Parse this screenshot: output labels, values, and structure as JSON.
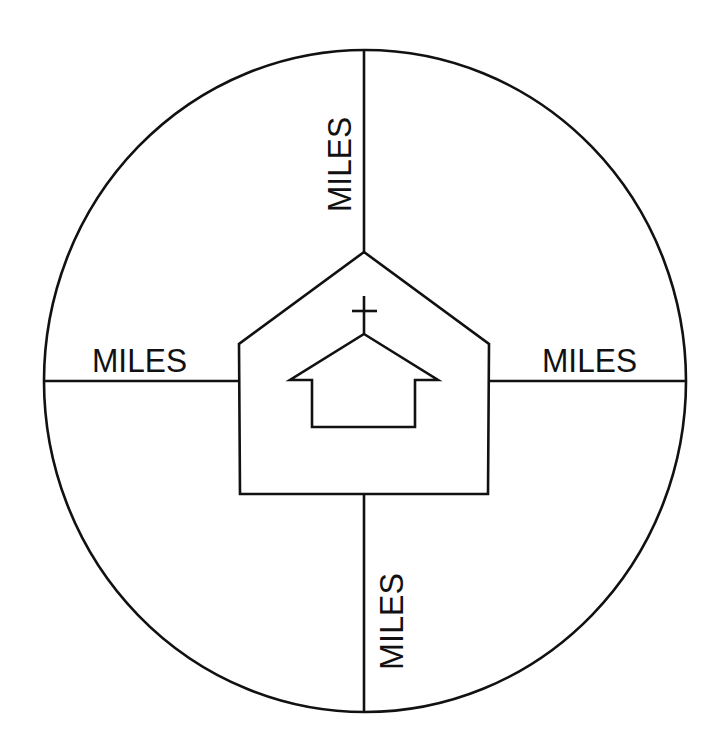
{
  "diagram": {
    "title": "",
    "colors": {
      "stroke": "#111111",
      "background": "#ffffff"
    },
    "outer_circle": {
      "cx": 365,
      "cy": 381,
      "rx": 321,
      "ry": 331
    },
    "center_shape": {
      "type": "pentagon",
      "points": [
        [
          364,
          252
        ],
        [
          489,
          344
        ],
        [
          488,
          494
        ],
        [
          240,
          494
        ],
        [
          239,
          344
        ]
      ]
    },
    "church_icon": {
      "name": "church-icon",
      "outline": [
        [
          364,
          334
        ],
        [
          438,
          380
        ],
        [
          415,
          380
        ],
        [
          415,
          427
        ],
        [
          312,
          427
        ],
        [
          312,
          380
        ],
        [
          290,
          380
        ]
      ],
      "cross": {
        "vertical": [
          [
            364,
            296
          ],
          [
            364,
            334
          ]
        ],
        "horizontal": [
          [
            352,
            311
          ],
          [
            377,
            311
          ]
        ]
      }
    },
    "spokes": {
      "top": {
        "from": [
          364,
          50
        ],
        "to": [
          364,
          252
        ]
      },
      "bottom": {
        "from": [
          364,
          494
        ],
        "to": [
          364,
          712
        ]
      },
      "left": {
        "from": [
          44,
          381
        ],
        "to": [
          239,
          381
        ]
      },
      "right": {
        "from": [
          489,
          381
        ],
        "to": [
          686,
          381
        ]
      }
    },
    "labels": {
      "top": "MILES",
      "left": "MILES",
      "right": "MILES",
      "bottom": "MILES"
    }
  }
}
